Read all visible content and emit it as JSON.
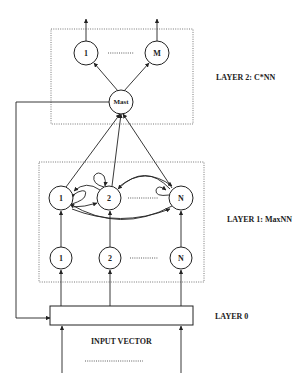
{
  "diagram": {
    "layer2": {
      "label": "LAYER 2: C*NN",
      "outputs": [
        "1",
        "M"
      ],
      "master": "Mast"
    },
    "layer1": {
      "label": "LAYER 1: MaxNN",
      "upper_nodes": [
        "1",
        "2",
        "N"
      ],
      "lower_nodes": [
        "1",
        "2",
        "N"
      ]
    },
    "layer0": {
      "label": "LAYER 0"
    },
    "input": {
      "label": "INPUT VECTOR"
    }
  }
}
